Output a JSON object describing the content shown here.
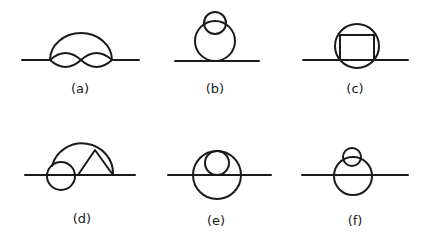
{
  "figure": {
    "stroke_color": "#1a1a1a",
    "background": "#ffffff"
  },
  "diagrams": [
    {
      "id": "a",
      "label": "(a)",
      "description": "Arc over two lens loops (figure-eight) on a line"
    },
    {
      "id": "b",
      "label": "(b)",
      "description": "Circle tangent to line with small overlapping circle on top"
    },
    {
      "id": "c",
      "label": "(c)",
      "description": "Circle on line with inscribed rectangle-shaped chord"
    },
    {
      "id": "d",
      "label": "(d)",
      "description": "Arc over small circle and triangle on line"
    },
    {
      "id": "e",
      "label": "(e)",
      "description": "Circle on line with inner tangent circle"
    },
    {
      "id": "f",
      "label": "(f)",
      "description": "Circle on line with small overlapping circle on top"
    }
  ]
}
